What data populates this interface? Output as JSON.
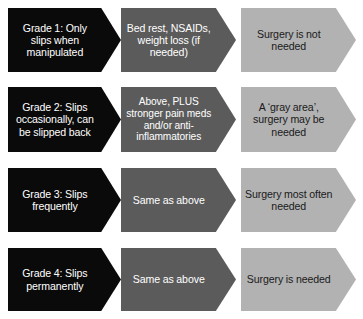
{
  "diagram": {
    "type": "chevron-matrix",
    "columns": [
      {
        "id": "grade",
        "name": "grade-severity",
        "fill": "#0a0a0a",
        "text_color": "#ffffff"
      },
      {
        "id": "treatment",
        "name": "treatment-plan",
        "fill": "#5b5b5b",
        "text_color": "#ffffff"
      },
      {
        "id": "surgery",
        "name": "surgery-need",
        "fill": "#b2b2b2",
        "text_color": "#1a1a1a"
      }
    ],
    "rows": [
      {
        "grade": "Grade 1: Only slips when manipulated",
        "treatment": "Bed rest, NSAIDs, weight loss (if needed)",
        "surgery": "Surgery is not needed"
      },
      {
        "grade": "Grade 2: Slips occasionally, can be slipped back",
        "treatment": "Above, PLUS stronger pain meds and/or anti-inflammatories",
        "surgery": "A ‘gray area’, surgery may be needed"
      },
      {
        "grade": "Grade 3: Slips frequently",
        "treatment": "Same as above",
        "surgery": "Surgery most often needed"
      },
      {
        "grade": "Grade 4: Slips permanently",
        "treatment": "Same as above",
        "surgery": "Surgery is needed"
      }
    ]
  }
}
